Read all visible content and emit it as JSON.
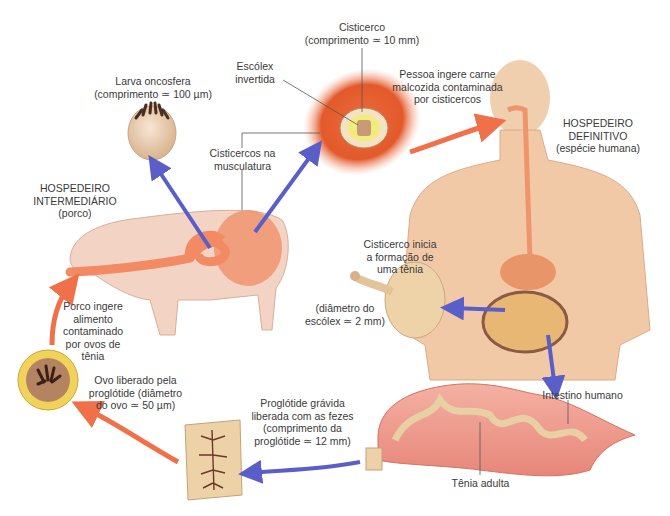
{
  "colors": {
    "orange_arrow": "#f0704a",
    "blue_arrow": "#5a5ec8",
    "skin": "#f2c9a8",
    "pig": "#f3d3c4",
    "intestine": "#e98b7a",
    "cyst_red": "#e0542a"
  },
  "labels": {
    "larva": [
      "Larva oncosfera",
      "(comprimento ≃ 100 µm)"
    ],
    "escolex": [
      "Escólex",
      "invertida"
    ],
    "cisticerco": [
      "Cisticerco",
      "(comprimento ≃ 10 mm)"
    ],
    "musculatura": [
      "Cisticercos na",
      "musculatura"
    ],
    "pessoa_ingere": [
      "Pessoa ingere carne",
      "malcozida contaminada",
      "por cisticercos"
    ],
    "hosp_definitivo": [
      "HOSPEDEIRO",
      "DEFINITIVO",
      "(espécie humana)"
    ],
    "hosp_intermediario": [
      "HOSPEDEIRO",
      "INTERMEDIÁRIO",
      "(porco)"
    ],
    "porco_ingere": [
      "Porco ingere",
      "alimento",
      "contaminado",
      "por ovos de",
      "tênia"
    ],
    "cisticerco_inicia": [
      "Cisticerco inicia",
      "a formação de",
      "uma tênia"
    ],
    "diametro_escolex": [
      "(diâmetro do",
      "escólex ≃ 2 mm)"
    ],
    "ovo_liberado": [
      "Ovo liberado pela",
      "proglótide (diâmetro",
      "do ovo ≃ 50 µm)"
    ],
    "proglotide": [
      "Proglótide grávida",
      "liberada com as fezes",
      "(comprimento da",
      "proglótide ≃ 12 mm)"
    ],
    "intestino": [
      "Intestino humano"
    ],
    "tenia_adulta": [
      "Tênia adulta"
    ]
  }
}
